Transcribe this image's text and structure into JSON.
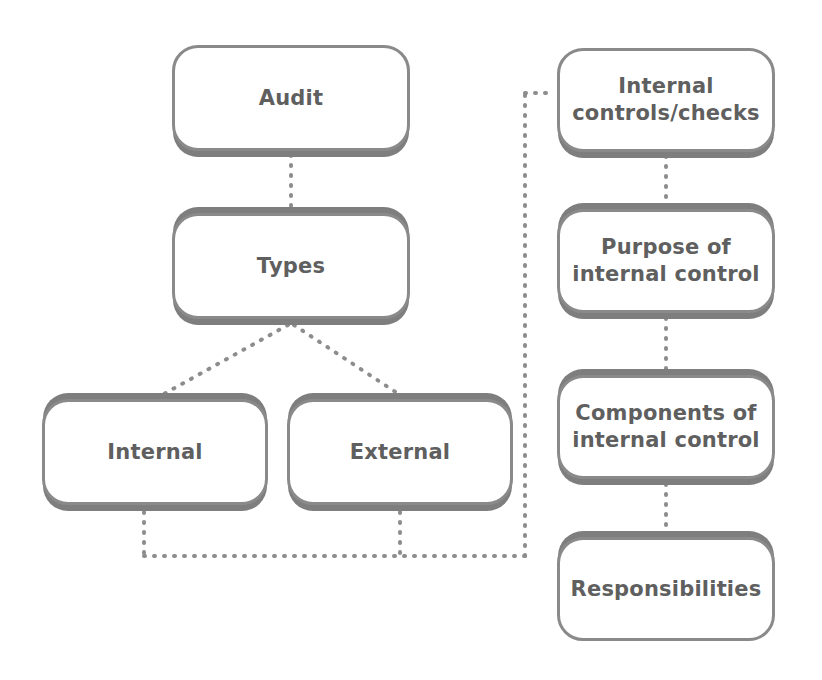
{
  "diagram": {
    "theme": {
      "background": "#ffffff",
      "node_fill": "#ffffff",
      "node_border": "#8a8a8a",
      "node_shadow": "#7e7e7e",
      "text_color": "#5f5f5f",
      "connector_color": "#8d8d8d"
    },
    "nodes": [
      {
        "id": "audit",
        "label": "Audit",
        "column": "left",
        "x": 172,
        "y": 45,
        "w": 238,
        "h": 106,
        "shadow": "bottom"
      },
      {
        "id": "types",
        "label": "Types",
        "column": "left",
        "x": 172,
        "y": 213,
        "w": 238,
        "h": 106,
        "shadow": "both"
      },
      {
        "id": "internal",
        "label": "Internal",
        "column": "left",
        "x": 42,
        "y": 399,
        "w": 226,
        "h": 106,
        "shadow": "both"
      },
      {
        "id": "external",
        "label": "External",
        "column": "left",
        "x": 287,
        "y": 399,
        "w": 226,
        "h": 106,
        "shadow": "both"
      },
      {
        "id": "internal-controls-checks",
        "label": "Internal\ncontrols/checks",
        "column": "right",
        "x": 557,
        "y": 48,
        "w": 218,
        "h": 104,
        "shadow": "bottom"
      },
      {
        "id": "purpose-of-internal-control",
        "label": "Purpose of\ninternal control",
        "column": "right",
        "x": 557,
        "y": 209,
        "w": 218,
        "h": 104,
        "shadow": "both"
      },
      {
        "id": "components-of-internal-control",
        "label": "Components of\ninternal control",
        "column": "right",
        "x": 557,
        "y": 375,
        "w": 218,
        "h": 104,
        "shadow": "both"
      },
      {
        "id": "responsibilities",
        "label": "Responsibilities",
        "column": "right",
        "x": 557,
        "y": 537,
        "w": 218,
        "h": 104,
        "shadow": "top"
      }
    ],
    "connectors": [
      {
        "id": "audit-to-types",
        "from": "audit",
        "to": "types",
        "style": "dotted-vertical",
        "points": "291,155 291,209"
      },
      {
        "id": "types-to-internal",
        "from": "types",
        "to": "internal",
        "style": "dotted-diagonal",
        "points": "288,325 162,395"
      },
      {
        "id": "types-to-external",
        "from": "types",
        "to": "external",
        "style": "dotted-diagonal",
        "points": "294,325 400,395"
      },
      {
        "id": "internal-drop",
        "from": "internal",
        "to": "bus",
        "style": "dotted-vertical",
        "points": "144,512 144,556"
      },
      {
        "id": "external-drop",
        "from": "external",
        "to": "bus",
        "style": "dotted-vertical",
        "points": "400,512 400,556"
      },
      {
        "id": "bus-horizontal",
        "from": "bus",
        "to": "riser",
        "style": "dotted-horizontal",
        "points": "144,556 525,556"
      },
      {
        "id": "riser-vertical",
        "from": "bus",
        "to": "internal-controls-checks",
        "style": "dotted-vertical",
        "points": "525,556 525,93"
      },
      {
        "id": "riser-into-controls",
        "from": "riser",
        "to": "internal-controls-checks",
        "style": "dotted-horizontal",
        "points": "525,93 553,93"
      },
      {
        "id": "controls-to-purpose",
        "from": "internal-controls-checks",
        "to": "purpose-of-internal-control",
        "style": "dotted-vertical",
        "points": "666,156 666,205"
      },
      {
        "id": "purpose-to-components",
        "from": "purpose-of-internal-control",
        "to": "components-of-internal-control",
        "style": "dotted-vertical",
        "points": "666,318 666,371"
      },
      {
        "id": "components-to-responsibilities",
        "from": "components-of-internal-control",
        "to": "responsibilities",
        "style": "dotted-vertical",
        "points": "666,484 666,533"
      }
    ]
  }
}
